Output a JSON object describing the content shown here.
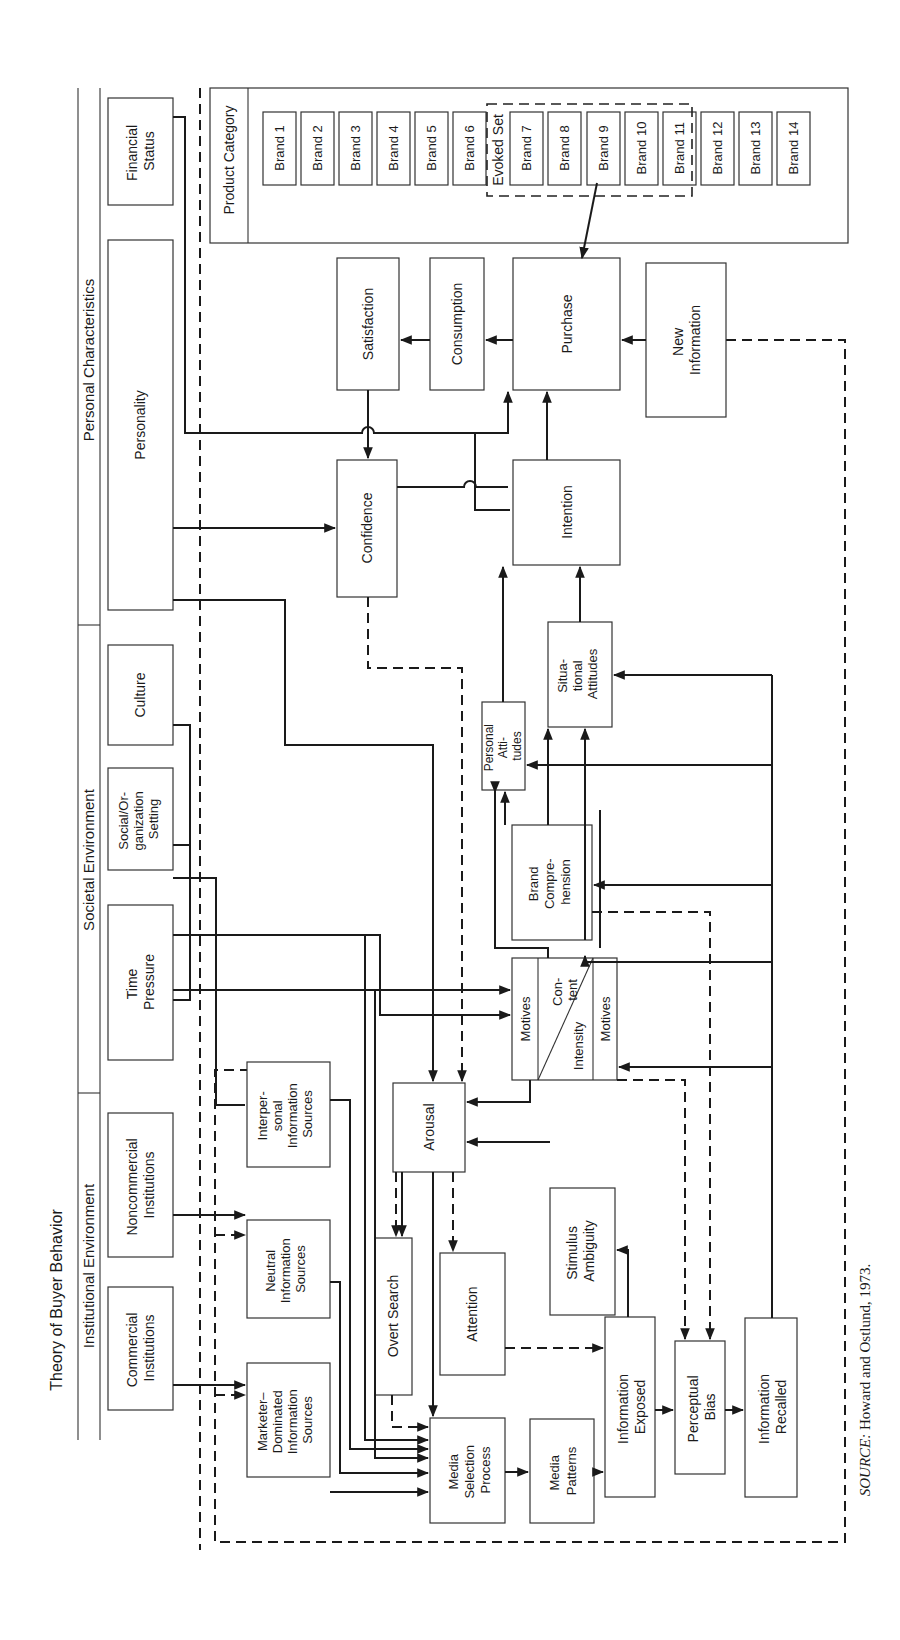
{
  "title": "Theory of Buyer Behavior",
  "sections": {
    "institutional": "Institutional Environment",
    "societal": "Societal Environment",
    "personal": "Personal Characteristics"
  },
  "exogenous": {
    "commercial": [
      "Commercial",
      "Institutions"
    ],
    "noncommercial": [
      "Noncommercial",
      "Institutions"
    ],
    "time_pressure": [
      "Time",
      "Pressure"
    ],
    "social_org": [
      "Social/Or-",
      "ganization",
      "Setting"
    ],
    "culture": [
      "Culture"
    ],
    "personality": [
      "Personality"
    ],
    "financial_status": [
      "Financial",
      "Status"
    ]
  },
  "product_category": {
    "label": "Product Category",
    "evoked_set_label": "Evoked Set",
    "brands": [
      "Brand 1",
      "Brand 2",
      "Brand 3",
      "Brand 4",
      "Brand 5",
      "Brand 6",
      "Brand 7",
      "Brand 8",
      "Brand 9",
      "Brand 10",
      "Brand 11",
      "Brand 12",
      "Brand 13",
      "Brand 14"
    ]
  },
  "nodes": {
    "satisfaction": [
      "Satisfaction"
    ],
    "consumption": [
      "Consumption"
    ],
    "purchase": [
      "Purchase"
    ],
    "new_information": [
      "New",
      "Information"
    ],
    "confidence": [
      "Confidence"
    ],
    "intention": [
      "Intention"
    ],
    "personal_attitudes": [
      "Personal",
      "Atti-",
      "tudes"
    ],
    "situational_attitudes": [
      "Situa-",
      "tional",
      "Attitudes"
    ],
    "brand_comprehension": [
      "Brand",
      "Compre-",
      "hension"
    ],
    "motives_left": "Motives",
    "motives_content": [
      "Con-",
      "tent"
    ],
    "motives_intensity": "Intensity",
    "motives_right": "Motives",
    "interpersonal": [
      "Interper-",
      "sonal",
      "Information",
      "Sources"
    ],
    "arousal": [
      "Arousal"
    ],
    "neutral": [
      "Neutral",
      "Information",
      "Sources"
    ],
    "overt_search": [
      "Overt Search"
    ],
    "attention": [
      "Attention"
    ],
    "stimulus_ambiguity": [
      "Stimulus",
      "Ambiguity"
    ],
    "marketer": [
      "Marketer–",
      "Dominated",
      "Information",
      "Sources"
    ],
    "media_selection": [
      "Media",
      "Selection",
      "Process"
    ],
    "media_patterns": [
      "Media",
      "Patterns"
    ],
    "information_exposed": [
      "Information",
      "Exposed"
    ],
    "perceptual_bias": [
      "Perceptual",
      "Bias"
    ],
    "information_recalled": [
      "Information",
      "Recalled"
    ]
  },
  "source": {
    "prefix": "SOURCE:",
    "text": " Howard and Ostlund, 1973."
  }
}
